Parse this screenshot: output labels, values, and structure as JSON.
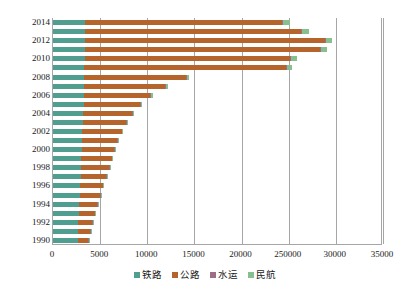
{
  "chart_data": {
    "type": "bar",
    "orientation": "horizontal",
    "stacked": true,
    "title": "",
    "xlabel": "",
    "ylabel": "",
    "xlim": [
      0,
      35000
    ],
    "grid": true,
    "legend_position": "bottom",
    "x_ticks": [
      "0",
      "5000",
      "10000",
      "15000",
      "20000",
      "250000",
      "30000",
      "35000"
    ],
    "x_tick_values": [
      0,
      5000,
      10000,
      15000,
      20000,
      25000,
      30000,
      35000
    ],
    "categories": [
      "1990",
      "1991",
      "1992",
      "1993",
      "1994",
      "1995",
      "1996",
      "1997",
      "1998",
      "1999",
      "2000",
      "2001",
      "2002",
      "2003",
      "2004",
      "2005",
      "2006",
      "2007",
      "2008",
      "2009",
      "2010",
      "2011",
      "2012",
      "2013",
      "2014"
    ],
    "y_tick_labels": [
      "2014",
      "2012",
      "2010",
      "2008",
      "2006",
      "2004",
      "2002",
      "2000",
      "1998",
      "1996",
      "1994",
      "1992",
      "1990"
    ],
    "series": [
      {
        "name": "铁路",
        "color": "#4f9e8f",
        "values": [
          2620,
          2640,
          2680,
          2720,
          2780,
          2830,
          2880,
          2930,
          2980,
          3010,
          3050,
          3080,
          3120,
          3150,
          3200,
          3250,
          3280,
          3300,
          3320,
          3340,
          3360,
          3380,
          3400,
          3420,
          3440
        ]
      },
      {
        "name": "公路",
        "color": "#b5652c",
        "values": [
          1100,
          1300,
          1500,
          1700,
          1900,
          2150,
          2400,
          2700,
          2950,
          3200,
          3450,
          3750,
          4150,
          4600,
          5200,
          6000,
          7050,
          8600,
          10800,
          21400,
          21800,
          24900,
          25400,
          22900,
          20900
        ]
      },
      {
        "name": "水运",
        "color": "#9d6f85",
        "values": [
          60,
          62,
          64,
          66,
          68,
          70,
          72,
          74,
          76,
          78,
          80,
          82,
          84,
          86,
          88,
          90,
          92,
          94,
          96,
          98,
          100,
          102,
          104,
          106,
          108
        ]
      },
      {
        "name": "民航",
        "color": "#87bf8e",
        "values": [
          10,
          12,
          14,
          17,
          20,
          24,
          28,
          33,
          38,
          44,
          52,
          60,
          72,
          85,
          105,
          130,
          160,
          200,
          250,
          520,
          590,
          650,
          700,
          720,
          740
        ]
      }
    ]
  },
  "legend": {
    "items": [
      {
        "label": "铁路",
        "color": "#4f9e8f"
      },
      {
        "label": "公路",
        "color": "#b5652c"
      },
      {
        "label": "水运",
        "color": "#9d6f85"
      },
      {
        "label": "民航",
        "color": "#87bf8e"
      }
    ]
  }
}
